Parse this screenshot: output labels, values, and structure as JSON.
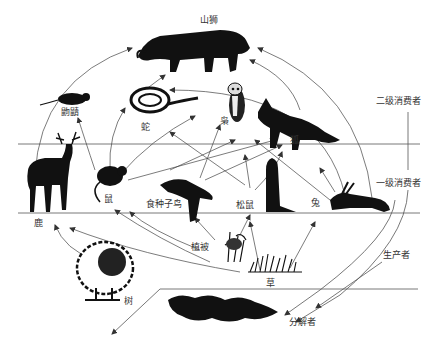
{
  "diagram": {
    "type": "food-web",
    "colors": {
      "ink": "#111111",
      "line": "#555555",
      "background": "#ffffff"
    },
    "organisms": {
      "mountain_lion": "山狮",
      "shrew": "鼩鼱",
      "snake": "蛇",
      "owl": "枭",
      "fox": "狐",
      "deer": "鹿",
      "mouse": "鼠",
      "seed_bird": "食种子鸟",
      "squirrel": "松鼠",
      "rabbit": "兔",
      "vegetation": "植被",
      "grass": "草",
      "tree": "树",
      "decomposers": "分解者"
    },
    "levels": {
      "secondary": "二级消费者",
      "primary": "一级消费者",
      "producers": "生产者"
    },
    "links": [
      [
        "鹿",
        "山狮"
      ],
      [
        "兔",
        "山狮"
      ],
      [
        "狐",
        "山狮"
      ],
      [
        "蛇",
        "山狮"
      ],
      [
        "鼠",
        "鼩鼱"
      ],
      [
        "鼠",
        "蛇"
      ],
      [
        "鼠",
        "枭"
      ],
      [
        "鼠",
        "狐"
      ],
      [
        "松鼠",
        "蛇"
      ],
      [
        "松鼠",
        "枭"
      ],
      [
        "松鼠",
        "狐"
      ],
      [
        "食种子鸟",
        "蛇"
      ],
      [
        "食种子鸟",
        "枭"
      ],
      [
        "兔",
        "狐"
      ],
      [
        "兔",
        "枭"
      ],
      [
        "植被",
        "松鼠"
      ],
      [
        "植被",
        "食种子鸟"
      ],
      [
        "植被",
        "鼠"
      ],
      [
        "草",
        "鼠"
      ],
      [
        "草",
        "兔"
      ],
      [
        "草",
        "松鼠"
      ],
      [
        "树",
        "鹿"
      ],
      [
        "植被",
        "鹿"
      ],
      [
        "二级消费者",
        "分解者"
      ],
      [
        "一级消费者",
        "分解者"
      ],
      [
        "生产者",
        "分解者"
      ]
    ]
  }
}
